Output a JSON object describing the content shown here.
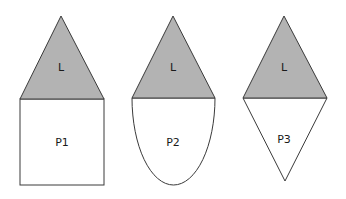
{
  "colors": {
    "roof_fill": "#b3b3b3",
    "body_fill": "#ffffff",
    "stroke": "#3a3a3a"
  },
  "shapes": [
    {
      "roof_label": "L",
      "body_label": "P1",
      "body_shape": "square"
    },
    {
      "roof_label": "L",
      "body_label": "P2",
      "body_shape": "half-ellipse"
    },
    {
      "roof_label": "L",
      "body_label": "P3",
      "body_shape": "inverted-triangle"
    }
  ]
}
